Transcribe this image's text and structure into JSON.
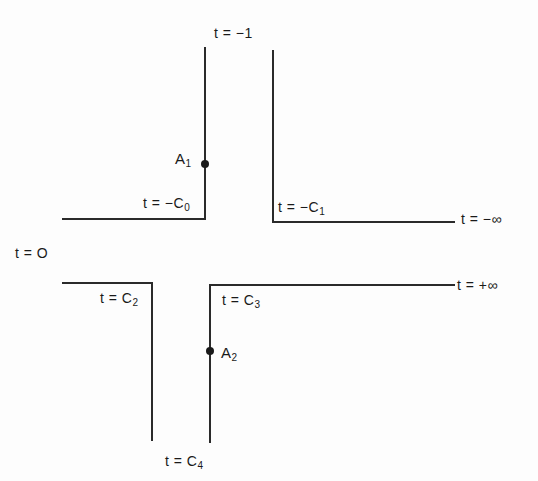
{
  "diagram": {
    "type": "cross-shaped channel boundary (conformal map parameter labels)",
    "labels": {
      "t_minus_one": "t = −1",
      "t_minus_c0": "t = −C",
      "t_minus_c0_sub": "0",
      "t_minus_c1": "t = −C",
      "t_minus_c1_sub": "1",
      "t_minus_inf": "t = −∞",
      "t_zero": "t = O",
      "t_c2": "t = C",
      "t_c2_sub": "2",
      "t_c3": "t = C",
      "t_c3_sub": "3",
      "t_plus_inf": "t = +∞",
      "t_c4": "t = C",
      "t_c4_sub": "4"
    },
    "points": {
      "a1": "A",
      "a1_sub": "1",
      "a2": "A",
      "a2_sub": "2"
    },
    "colors": {
      "line": "#2a2a2a",
      "background": "#fdfdfd"
    }
  }
}
